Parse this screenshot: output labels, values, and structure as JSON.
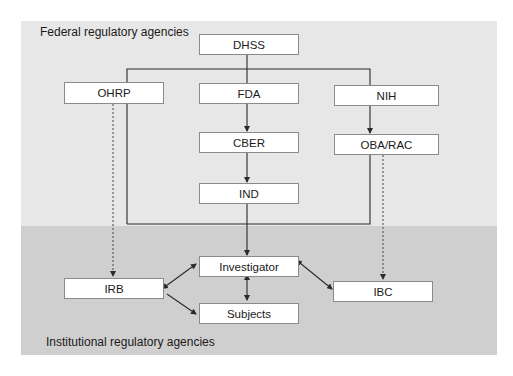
{
  "diagram": {
    "regions": {
      "federal": {
        "label": "Federal regulatory agencies",
        "color": "#e7e7e7"
      },
      "institutional": {
        "label": "Institutional regulatory agencies",
        "color": "#cfcfcf"
      }
    },
    "nodes": {
      "dhss": "DHSS",
      "ohrp": "OHRP",
      "fda": "FDA",
      "nih": "NIH",
      "cber": "CBER",
      "oba_rac": "OBA/RAC",
      "ind": "IND",
      "investigator": "Investigator",
      "irb": "IRB",
      "ibc": "IBC",
      "subjects": "Subjects"
    },
    "edges": [
      {
        "from": "DHSS",
        "to": "FDA",
        "style": "solid"
      },
      {
        "from": "DHSS",
        "to": "NIH",
        "style": "solid"
      },
      {
        "from": "DHSS",
        "to": "Investigator",
        "style": "solid",
        "via": "left bracket past OHRP"
      },
      {
        "from": "FDA",
        "to": "CBER",
        "style": "solid-arrow"
      },
      {
        "from": "CBER",
        "to": "IND",
        "style": "solid-arrow"
      },
      {
        "from": "IND",
        "to": "Investigator",
        "style": "solid-arrow"
      },
      {
        "from": "NIH",
        "to": "OBA/RAC",
        "style": "solid-arrow"
      },
      {
        "from": "OBA/RAC",
        "to": "Investigator",
        "style": "solid",
        "via": "right bracket"
      },
      {
        "from": "OHRP",
        "to": "IRB",
        "style": "dashed-arrow"
      },
      {
        "from": "OBA/RAC",
        "to": "IBC",
        "style": "dashed-arrow"
      },
      {
        "from": "IRB",
        "to": "Investigator",
        "style": "double-arrow"
      },
      {
        "from": "IRB",
        "to": "Subjects",
        "style": "solid-arrow"
      },
      {
        "from": "Investigator",
        "to": "Subjects",
        "style": "double-arrow"
      },
      {
        "from": "Investigator",
        "to": "IBC",
        "style": "double-arrow"
      }
    ],
    "colors": {
      "line": "#2a2a2a",
      "box_border": "#8a8a8a",
      "box_fill": "#ffffff"
    }
  }
}
